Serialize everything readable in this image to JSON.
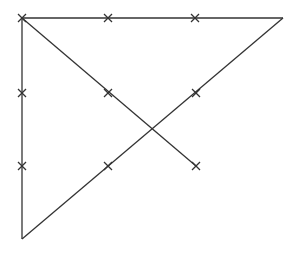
{
  "diagram": {
    "width": 298,
    "height": 256,
    "stroke_color": "#333333",
    "background": "#ffffff",
    "points": {
      "A": [
        22,
        18
      ],
      "B": [
        283,
        18
      ],
      "C": [
        22,
        239
      ],
      "D": [
        196,
        166
      ]
    },
    "segments": [
      {
        "name": "top-edge",
        "from": "A",
        "to": "B"
      },
      {
        "name": "left-edge",
        "from": "A",
        "to": "C"
      },
      {
        "name": "hypotenuse",
        "from": "B",
        "to": "C"
      },
      {
        "name": "diagonal",
        "from": "A",
        "to": "D"
      }
    ],
    "tick_marks": [
      [
        22,
        18
      ],
      [
        108,
        18
      ],
      [
        195,
        18
      ],
      [
        22,
        93
      ],
      [
        22,
        166
      ],
      [
        108,
        93
      ],
      [
        196,
        166
      ],
      [
        196,
        93
      ],
      [
        108,
        166
      ]
    ]
  }
}
